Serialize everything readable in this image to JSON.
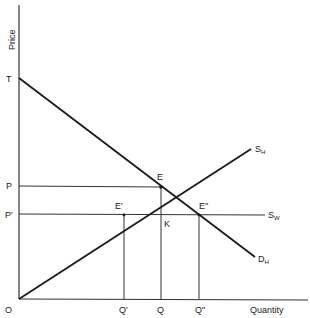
{
  "diagram": {
    "type": "supply-demand",
    "axes": {
      "y_label": "Price",
      "x_label": "Quantity",
      "origin_label": "O"
    },
    "price_labels": {
      "T": "T",
      "P": "P",
      "P_prime": "P'"
    },
    "quantity_labels": {
      "Q_prime": "Q'",
      "Q": "Q",
      "Q_double_prime": "Q\""
    },
    "points": {
      "E": "E",
      "E_prime": "E'",
      "E_double_prime": "E\"",
      "K": "K"
    },
    "curves": {
      "home_supply": {
        "base": "S",
        "sub": "H"
      },
      "world_supply": {
        "base": "S",
        "sub": "W"
      },
      "home_demand": {
        "base": "D",
        "sub": "H"
      }
    },
    "colors": {
      "line": "#1a1a1a",
      "background": "#ffffff"
    }
  }
}
